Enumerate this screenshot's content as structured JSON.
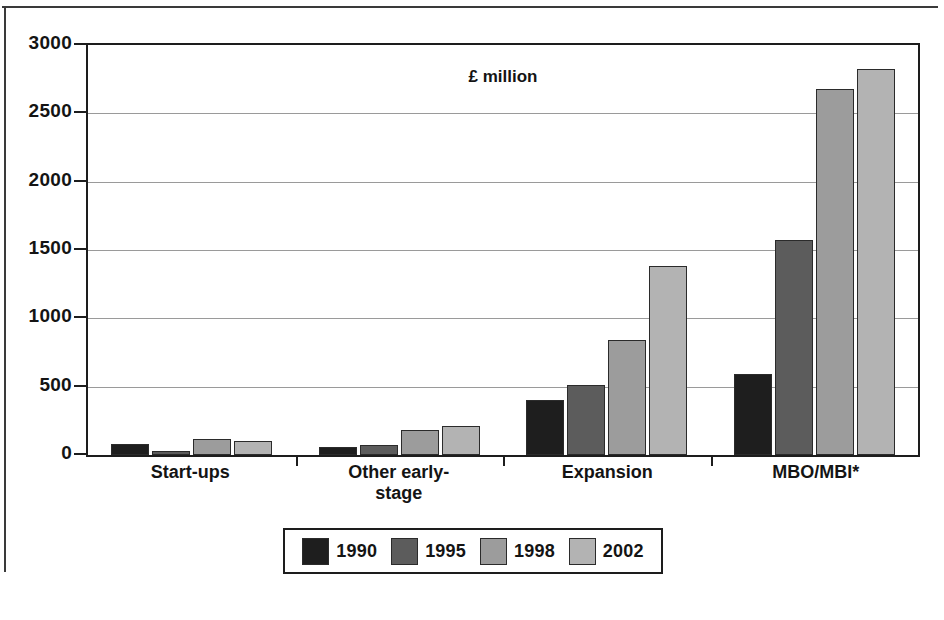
{
  "chart_data": {
    "type": "bar",
    "title": "",
    "unit_note": "£ million",
    "xlabel": "",
    "ylabel": "",
    "ylim": [
      0,
      3000
    ],
    "ytick_values": [
      0,
      500,
      1000,
      1500,
      2000,
      2500,
      3000
    ],
    "ytick_labels": [
      "0",
      "500",
      "1000",
      "1500",
      "2000",
      "2500",
      "3000"
    ],
    "grid": true,
    "legend_position": "bottom",
    "categories": [
      "Start-ups",
      "Other early-stage",
      "Expansion",
      "MBO/MBI*"
    ],
    "series": [
      {
        "name": "1990",
        "color": "#1e1e1e",
        "values": [
          80,
          60,
          405,
          595
        ]
      },
      {
        "name": "1995",
        "color": "#5c5c5c",
        "values": [
          30,
          75,
          515,
          1570
        ]
      },
      {
        "name": "1998",
        "color": "#9c9c9c",
        "values": [
          120,
          185,
          845,
          2675
        ]
      },
      {
        "name": "2002",
        "color": "#b3b3b3",
        "values": [
          105,
          210,
          1385,
          2825
        ]
      }
    ]
  },
  "axis": {
    "ticks": [
      {
        "label": "3000",
        "value": 3000
      },
      {
        "label": "2500",
        "value": 2500
      },
      {
        "label": "2000",
        "value": 2000
      },
      {
        "label": "1500",
        "value": 1500
      },
      {
        "label": "1000",
        "value": 1000
      },
      {
        "label": "500",
        "value": 500
      },
      {
        "label": "0",
        "value": 0
      }
    ]
  },
  "categories": [
    {
      "label": "Start-ups"
    },
    {
      "label": "Other early-\nstage"
    },
    {
      "label": "Expansion"
    },
    {
      "label": "MBO/MBI*"
    }
  ],
  "legend": {
    "items": [
      {
        "label": "1990",
        "color": "#1e1e1e"
      },
      {
        "label": "1995",
        "color": "#5c5c5c"
      },
      {
        "label": "1998",
        "color": "#9c9c9c"
      },
      {
        "label": "2002",
        "color": "#b3b3b3"
      }
    ]
  },
  "unit_note": "£ million"
}
